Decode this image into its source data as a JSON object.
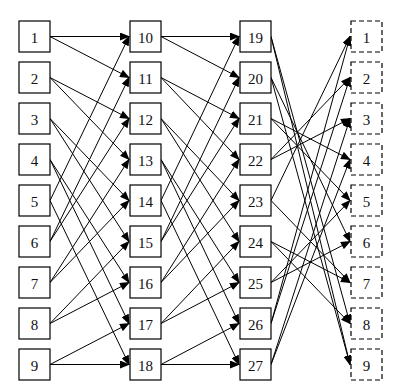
{
  "diagram": {
    "type": "layered-network",
    "columns": [
      {
        "name": "input",
        "style": "solid",
        "x": 19,
        "nodes": [
          "1",
          "2",
          "3",
          "4",
          "5",
          "6",
          "7",
          "8",
          "9"
        ]
      },
      {
        "name": "stage-1",
        "style": "solid",
        "x": 130,
        "nodes": [
          "10",
          "11",
          "12",
          "13",
          "14",
          "15",
          "16",
          "17",
          "18"
        ]
      },
      {
        "name": "stage-2",
        "style": "solid",
        "x": 240,
        "nodes": [
          "19",
          "20",
          "21",
          "22",
          "23",
          "24",
          "25",
          "26",
          "27"
        ]
      },
      {
        "name": "output",
        "style": "dashed",
        "x": 351,
        "nodes": [
          "1",
          "2",
          "3",
          "4",
          "5",
          "6",
          "7",
          "8",
          "9"
        ]
      }
    ],
    "layout": {
      "top": 21,
      "row_spacing": 41,
      "box_w": 31,
      "box_h": 31
    },
    "edges": [
      [
        [
          0,
          0
        ],
        [
          1,
          0
        ]
      ],
      [
        [
          0,
          0
        ],
        [
          1,
          1
        ]
      ],
      [
        [
          0,
          1
        ],
        [
          1,
          2
        ]
      ],
      [
        [
          0,
          1
        ],
        [
          1,
          3
        ]
      ],
      [
        [
          0,
          2
        ],
        [
          1,
          4
        ]
      ],
      [
        [
          0,
          2
        ],
        [
          1,
          5
        ]
      ],
      [
        [
          0,
          3
        ],
        [
          1,
          6
        ]
      ],
      [
        [
          0,
          3
        ],
        [
          1,
          7
        ]
      ],
      [
        [
          0,
          4
        ],
        [
          1,
          8
        ]
      ],
      [
        [
          0,
          4
        ],
        [
          1,
          0
        ]
      ],
      [
        [
          0,
          5
        ],
        [
          1,
          1
        ]
      ],
      [
        [
          0,
          5
        ],
        [
          1,
          2
        ]
      ],
      [
        [
          0,
          6
        ],
        [
          1,
          3
        ]
      ],
      [
        [
          0,
          6
        ],
        [
          1,
          4
        ]
      ],
      [
        [
          0,
          7
        ],
        [
          1,
          5
        ]
      ],
      [
        [
          0,
          7
        ],
        [
          1,
          6
        ]
      ],
      [
        [
          0,
          8
        ],
        [
          1,
          7
        ]
      ],
      [
        [
          0,
          8
        ],
        [
          1,
          8
        ]
      ],
      [
        [
          1,
          0
        ],
        [
          2,
          0
        ]
      ],
      [
        [
          1,
          0
        ],
        [
          2,
          1
        ]
      ],
      [
        [
          1,
          1
        ],
        [
          2,
          2
        ]
      ],
      [
        [
          1,
          1
        ],
        [
          2,
          3
        ]
      ],
      [
        [
          1,
          2
        ],
        [
          2,
          4
        ]
      ],
      [
        [
          1,
          2
        ],
        [
          2,
          5
        ]
      ],
      [
        [
          1,
          3
        ],
        [
          2,
          6
        ]
      ],
      [
        [
          1,
          3
        ],
        [
          2,
          7
        ]
      ],
      [
        [
          1,
          4
        ],
        [
          2,
          8
        ]
      ],
      [
        [
          1,
          4
        ],
        [
          2,
          0
        ]
      ],
      [
        [
          1,
          5
        ],
        [
          2,
          1
        ]
      ],
      [
        [
          1,
          5
        ],
        [
          2,
          2
        ]
      ],
      [
        [
          1,
          6
        ],
        [
          2,
          3
        ]
      ],
      [
        [
          1,
          6
        ],
        [
          2,
          4
        ]
      ],
      [
        [
          1,
          7
        ],
        [
          2,
          5
        ]
      ],
      [
        [
          1,
          7
        ],
        [
          2,
          6
        ]
      ],
      [
        [
          1,
          8
        ],
        [
          2,
          7
        ]
      ],
      [
        [
          1,
          8
        ],
        [
          2,
          8
        ]
      ],
      [
        [
          2,
          0
        ],
        [
          3,
          7
        ]
      ],
      [
        [
          2,
          0
        ],
        [
          3,
          8
        ]
      ],
      [
        [
          2,
          1
        ],
        [
          3,
          5
        ]
      ],
      [
        [
          2,
          1
        ],
        [
          3,
          8
        ]
      ],
      [
        [
          2,
          2
        ],
        [
          3,
          3
        ]
      ],
      [
        [
          2,
          2
        ],
        [
          3,
          4
        ]
      ],
      [
        [
          2,
          3
        ],
        [
          3,
          1
        ]
      ],
      [
        [
          2,
          3
        ],
        [
          3,
          2
        ]
      ],
      [
        [
          2,
          4
        ],
        [
          3,
          0
        ]
      ],
      [
        [
          2,
          4
        ],
        [
          3,
          6
        ]
      ],
      [
        [
          2,
          5
        ],
        [
          3,
          6
        ]
      ],
      [
        [
          2,
          5
        ],
        [
          3,
          7
        ]
      ],
      [
        [
          2,
          6
        ],
        [
          3,
          4
        ]
      ],
      [
        [
          2,
          6
        ],
        [
          3,
          5
        ]
      ],
      [
        [
          2,
          7
        ],
        [
          3,
          0
        ]
      ],
      [
        [
          2,
          7
        ],
        [
          3,
          1
        ]
      ],
      [
        [
          2,
          8
        ],
        [
          3,
          2
        ]
      ],
      [
        [
          2,
          8
        ],
        [
          3,
          3
        ]
      ]
    ]
  }
}
